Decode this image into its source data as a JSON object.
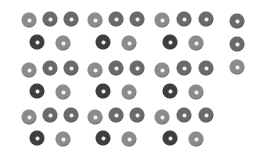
{
  "colors": {
    "background": "#ffffff",
    "light": "#8c8c8c",
    "medium": "#6a6a6a",
    "dark": "#3e3e3e"
  },
  "rings": [
    {
      "x": 29,
      "y": 20,
      "shade": "light"
    },
    {
      "x": 50,
      "y": 19,
      "shade": "medium"
    },
    {
      "x": 71,
      "y": 19,
      "shade": "medium"
    },
    {
      "x": 37,
      "y": 42,
      "shade": "dark"
    },
    {
      "x": 63,
      "y": 43,
      "shade": "light"
    },
    {
      "x": 95,
      "y": 20,
      "shade": "light"
    },
    {
      "x": 116,
      "y": 19,
      "shade": "medium"
    },
    {
      "x": 137,
      "y": 19,
      "shade": "medium"
    },
    {
      "x": 103,
      "y": 42,
      "shade": "dark"
    },
    {
      "x": 129,
      "y": 43,
      "shade": "light"
    },
    {
      "x": 162,
      "y": 20,
      "shade": "light"
    },
    {
      "x": 184,
      "y": 19,
      "shade": "medium"
    },
    {
      "x": 206,
      "y": 19,
      "shade": "medium"
    },
    {
      "x": 170,
      "y": 42,
      "shade": "dark"
    },
    {
      "x": 196,
      "y": 43,
      "shade": "light"
    },
    {
      "x": 237,
      "y": 21,
      "shade": "medium"
    },
    {
      "x": 237,
      "y": 44,
      "shade": "medium"
    },
    {
      "x": 237,
      "y": 67,
      "shade": "light"
    },
    {
      "x": 29,
      "y": 70,
      "shade": "light"
    },
    {
      "x": 50,
      "y": 68,
      "shade": "medium"
    },
    {
      "x": 71,
      "y": 68,
      "shade": "medium"
    },
    {
      "x": 37,
      "y": 91,
      "shade": "dark"
    },
    {
      "x": 63,
      "y": 92,
      "shade": "light"
    },
    {
      "x": 95,
      "y": 70,
      "shade": "light"
    },
    {
      "x": 116,
      "y": 68,
      "shade": "medium"
    },
    {
      "x": 137,
      "y": 68,
      "shade": "medium"
    },
    {
      "x": 103,
      "y": 91,
      "shade": "dark"
    },
    {
      "x": 129,
      "y": 92,
      "shade": "light"
    },
    {
      "x": 162,
      "y": 70,
      "shade": "light"
    },
    {
      "x": 184,
      "y": 68,
      "shade": "medium"
    },
    {
      "x": 206,
      "y": 68,
      "shade": "medium"
    },
    {
      "x": 170,
      "y": 91,
      "shade": "dark"
    },
    {
      "x": 196,
      "y": 92,
      "shade": "light"
    },
    {
      "x": 29,
      "y": 117,
      "shade": "light"
    },
    {
      "x": 50,
      "y": 115,
      "shade": "medium"
    },
    {
      "x": 71,
      "y": 115,
      "shade": "medium"
    },
    {
      "x": 37,
      "y": 138,
      "shade": "dark"
    },
    {
      "x": 63,
      "y": 139,
      "shade": "light"
    },
    {
      "x": 95,
      "y": 117,
      "shade": "light"
    },
    {
      "x": 116,
      "y": 115,
      "shade": "medium"
    },
    {
      "x": 137,
      "y": 115,
      "shade": "medium"
    },
    {
      "x": 103,
      "y": 138,
      "shade": "dark"
    },
    {
      "x": 129,
      "y": 139,
      "shade": "light"
    },
    {
      "x": 162,
      "y": 117,
      "shade": "light"
    },
    {
      "x": 184,
      "y": 115,
      "shade": "medium"
    },
    {
      "x": 206,
      "y": 115,
      "shade": "medium"
    },
    {
      "x": 170,
      "y": 138,
      "shade": "dark"
    },
    {
      "x": 196,
      "y": 139,
      "shade": "light"
    }
  ]
}
